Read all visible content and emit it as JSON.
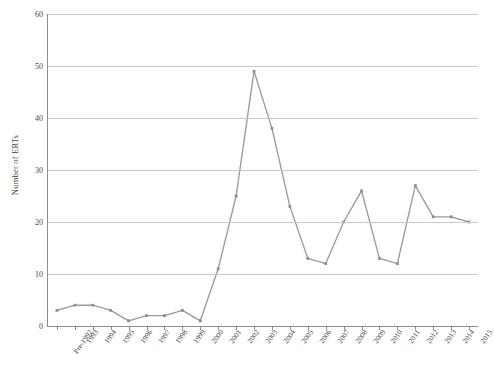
{
  "chart_data": {
    "type": "line",
    "title": "",
    "xlabel": "",
    "ylabel": "Number of ERTs",
    "ylim": [
      0,
      60
    ],
    "ytick_step": 10,
    "yticks": [
      0,
      10,
      20,
      30,
      40,
      50,
      60
    ],
    "grid": true,
    "legend": "none",
    "series_color": "#9a9a9a",
    "categories": [
      "Pre-1992",
      "1993",
      "1994",
      "1995",
      "1996",
      "1997",
      "1998",
      "1999",
      "2000",
      "2001",
      "2002",
      "2003",
      "2004",
      "2005",
      "2006",
      "2007",
      "2008",
      "2009",
      "2010",
      "2011",
      "2012",
      "2013",
      "2014",
      "2015"
    ],
    "series": [
      {
        "name": "Number of ERTs",
        "values": [
          3,
          4,
          4,
          3,
          1,
          2,
          2,
          3,
          1,
          11,
          25,
          49,
          38,
          23,
          13,
          12,
          20,
          26,
          13,
          12,
          27,
          21,
          21,
          20
        ]
      }
    ]
  }
}
